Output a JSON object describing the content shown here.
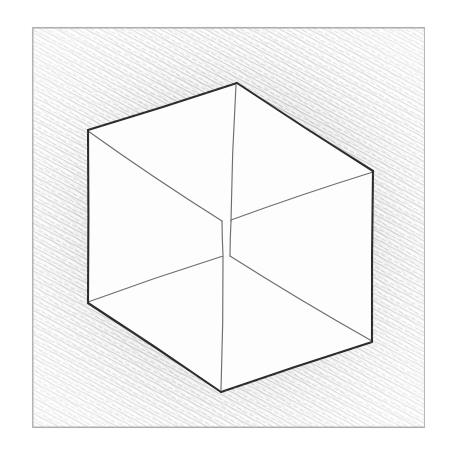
{
  "artwork": {
    "title": "Necker Cube Pencil Sketch",
    "medium": "graphite pencil on paper",
    "subject": "ambiguous wireframe cube",
    "canvas": {
      "width": 452,
      "height": 454,
      "background": "#ffffff"
    },
    "palette": {
      "paper": "#ffffff",
      "outer_edge_stroke": "#2b2b2b",
      "inner_edge_stroke": "#6d6d6d",
      "hatch_stroke": "#9a9a9a",
      "frame_stroke": "#b8b8b8",
      "shadow_tone": "#8e8e8e"
    },
    "frame": {
      "name": "drawn-border-rectangle",
      "x": 32,
      "y": 27,
      "width": 393,
      "height": 401,
      "stroke_width": 1.1
    },
    "cube": {
      "description": "Hexagonal silhouette wireframe cube with split central junction",
      "outer_hexagon": [
        {
          "label": "top",
          "x": 237,
          "y": 83
        },
        {
          "label": "upper-right",
          "x": 373,
          "y": 171
        },
        {
          "label": "lower-right",
          "x": 372,
          "y": 342
        },
        {
          "label": "bottom",
          "x": 221,
          "y": 392
        },
        {
          "label": "lower-left",
          "x": 88,
          "y": 303
        },
        {
          "label": "upper-left",
          "x": 88,
          "y": 130
        }
      ],
      "center_junctions": {
        "upper": {
          "x": 222,
          "y": 221
        },
        "lower": {
          "x": 229,
          "y": 256
        }
      },
      "inner_edges": [
        {
          "name": "upper-left-diagonal",
          "from": "upper-left",
          "to": "center-upper"
        },
        {
          "name": "upper-right-diagonal",
          "from": "center-upper",
          "to": "upper-right"
        },
        {
          "name": "lower-left-diagonal",
          "from": "lower-left",
          "to": "center-lower"
        },
        {
          "name": "lower-right-diagonal",
          "from": "center-lower",
          "to": "lower-right"
        },
        {
          "name": "top-vertical",
          "from": "top",
          "to": "center-upper"
        },
        {
          "name": "center-vertical-left",
          "from": "center-upper",
          "to": "center-lower"
        },
        {
          "name": "center-vertical-right",
          "from": "center-upper-right",
          "to": "center-lower-right"
        },
        {
          "name": "bottom-vertical",
          "from": "center-lower",
          "to": "bottom"
        }
      ],
      "outer_stroke_width": 2.1,
      "inner_stroke_width": 1.15
    },
    "shading": {
      "region": "background outside cube, inside frame",
      "technique": "fine diagonal hatching",
      "stroke_angle_degrees": -62,
      "density": "dense near cube edges, lighter near frame corners"
    }
  }
}
